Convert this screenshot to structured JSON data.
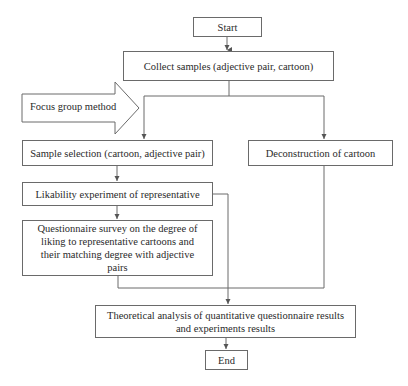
{
  "diagram": {
    "type": "flowchart",
    "nodes": {
      "start": "Start",
      "collect": "Collect samples (adjective pair, cartoon)",
      "focus_group": "Focus group method",
      "sample_selection": "Sample selection (cartoon, adjective pair)",
      "deconstruction": "Deconstruction of cartoon",
      "likability": "Likability experiment of representative",
      "questionnaire": "Questionnaire survey on the degree of liking to representative cartoons and their matching degree with adjective pairs",
      "theoretical": "Theoretical analysis of quantitative questionnaire results and experiments results",
      "end": "End"
    },
    "edges": [
      {
        "from": "start",
        "to": "collect"
      },
      {
        "from": "collect",
        "to": "sample_selection"
      },
      {
        "from": "collect",
        "to": "deconstruction"
      },
      {
        "from": "focus_group",
        "to": "sample_selection",
        "style": "block-arrow"
      },
      {
        "from": "sample_selection",
        "to": "likability"
      },
      {
        "from": "likability",
        "to": "questionnaire"
      },
      {
        "from": "likability",
        "to": "theoretical"
      },
      {
        "from": "questionnaire",
        "to": "theoretical"
      },
      {
        "from": "deconstruction",
        "to": "theoretical"
      },
      {
        "from": "theoretical",
        "to": "end"
      }
    ],
    "colors": {
      "stroke": "#6a6a6a",
      "text": "#2a2a2a",
      "background": "#ffffff"
    }
  }
}
